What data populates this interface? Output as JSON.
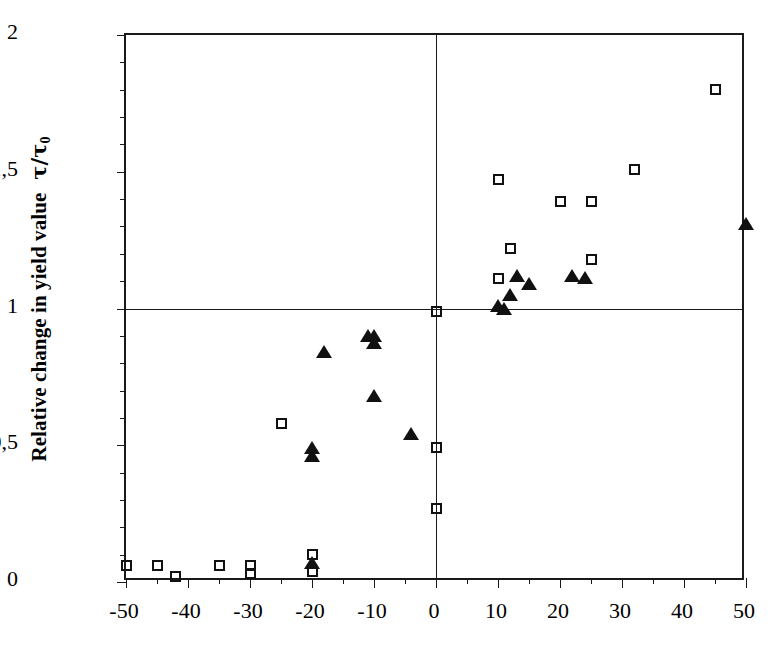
{
  "chart_data": {
    "type": "scatter",
    "title": "",
    "xlabel": "",
    "ylabel": "Relative change in yield value",
    "ylabel_symbol": "τ/τ",
    "ylabel_subscript": "0",
    "xlim": [
      -50,
      50
    ],
    "ylim": [
      0,
      2
    ],
    "grid": false,
    "legend": "none",
    "reference_lines": [
      {
        "axis": "y",
        "value": 1
      },
      {
        "axis": "x",
        "value": 0
      }
    ],
    "xticks": [
      -50,
      -40,
      -30,
      -20,
      -10,
      0,
      10,
      20,
      30,
      40,
      50
    ],
    "xtick_labels": [
      "-50",
      "-40",
      "-30",
      "-20",
      "-10",
      "0",
      "10",
      "20",
      "30",
      "40",
      "50"
    ],
    "xtick_minor_step": 5,
    "yticks": [
      0,
      0.5,
      1,
      1.5,
      2
    ],
    "ytick_labels": [
      "0",
      "0,5",
      "1",
      "1,5",
      "2"
    ],
    "ytick_minor_step": 0.1,
    "series": [
      {
        "name": "open-square",
        "marker": "square",
        "fill": "none",
        "color": "#111111",
        "points": [
          [
            -50,
            0.06
          ],
          [
            -45,
            0.06
          ],
          [
            -42,
            0.02
          ],
          [
            -35,
            0.06
          ],
          [
            -30,
            0.06
          ],
          [
            -30,
            0.03
          ],
          [
            -25,
            0.58
          ],
          [
            -20,
            0.1
          ],
          [
            -20,
            0.04
          ],
          [
            0,
            0.99
          ],
          [
            0,
            0.49
          ],
          [
            0,
            0.27
          ],
          [
            10,
            1.47
          ],
          [
            10,
            1.11
          ],
          [
            12,
            1.22
          ],
          [
            20,
            1.39
          ],
          [
            25,
            1.39
          ],
          [
            25,
            1.18
          ],
          [
            32,
            1.51
          ],
          [
            45,
            1.8
          ]
        ]
      },
      {
        "name": "filled-triangle",
        "marker": "triangle",
        "fill": "solid",
        "color": "#111111",
        "points": [
          [
            -20,
            0.07
          ],
          [
            -20,
            0.49
          ],
          [
            -20,
            0.46
          ],
          [
            -18,
            0.84
          ],
          [
            -11,
            0.9
          ],
          [
            -10,
            0.9
          ],
          [
            -10,
            0.875
          ],
          [
            -10,
            0.68
          ],
          [
            -4,
            0.54
          ],
          [
            10,
            1.01
          ],
          [
            11,
            1.0
          ],
          [
            12,
            1.05
          ],
          [
            13,
            1.12
          ],
          [
            15,
            1.09
          ],
          [
            22,
            1.12
          ],
          [
            24,
            1.11
          ],
          [
            50,
            1.31
          ]
        ]
      }
    ]
  }
}
